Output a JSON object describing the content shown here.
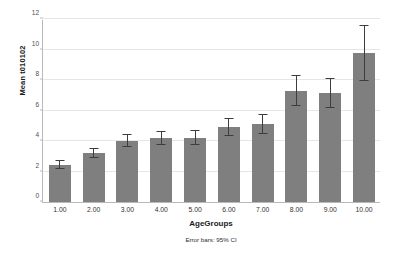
{
  "chart_data": {
    "type": "bar",
    "title": "",
    "xlabel": "AgeGroups",
    "ylabel": "Mean t010102",
    "categories": [
      "1.00",
      "2.00",
      "3.00",
      "4.00",
      "5.00",
      "6.00",
      "7.00",
      "8.00",
      "9.00",
      "10.00"
    ],
    "values": [
      2.43,
      3.2,
      4.03,
      4.2,
      4.22,
      4.95,
      5.13,
      7.3,
      7.15,
      9.77
    ],
    "error_low": [
      2.15,
      2.9,
      3.58,
      3.75,
      3.72,
      4.35,
      4.45,
      6.3,
      6.18,
      7.92
    ],
    "error_high": [
      2.75,
      3.55,
      4.45,
      4.65,
      4.7,
      5.52,
      5.8,
      8.32,
      8.15,
      11.6
    ],
    "error_type": "95% CI",
    "ylim": [
      0,
      12
    ],
    "yticks": [
      0,
      2,
      4,
      6,
      8,
      10,
      12
    ],
    "ytick_labels": [
      "0",
      "2",
      "4",
      "6",
      "8",
      "10",
      "12"
    ],
    "grid": true,
    "legend": false,
    "footnote": "Error bars: 95% CI",
    "bar_color": "#7f7f7f",
    "error_color": "#3d3d3d",
    "grid_color": "#e6e6e6",
    "axis_color": "#b9b9b9",
    "background": "#ffffff"
  }
}
